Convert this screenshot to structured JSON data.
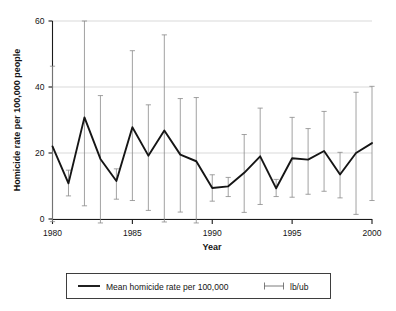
{
  "chart_data": {
    "type": "line",
    "title": "",
    "xlabel": "Year",
    "ylabel": "Homicide rate per 100,000 people",
    "xlim": [
      1980,
      2000
    ],
    "ylim": [
      0,
      60
    ],
    "yticks": [
      0,
      20,
      40,
      60
    ],
    "ytick_labels": [
      "0",
      "20",
      "40",
      "60"
    ],
    "xticks": [
      1980,
      1985,
      1990,
      1995,
      2000
    ],
    "xtick_labels": [
      "1980",
      "1985",
      "1990",
      "1995",
      "2000"
    ],
    "grid": true,
    "legend_position": "below-plot",
    "x": [
      1980,
      1981,
      1982,
      1983,
      1984,
      1985,
      1986,
      1987,
      1988,
      1989,
      1990,
      1991,
      1992,
      1993,
      1994,
      1995,
      1996,
      1997,
      1998,
      1999,
      2000
    ],
    "categories": [
      "1980",
      "1981",
      "1982",
      "1983",
      "1984",
      "1985",
      "1986",
      "1987",
      "1988",
      "1989",
      "1990",
      "1991",
      "1992",
      "1993",
      "1994",
      "1995",
      "1996",
      "1997",
      "1998",
      "1999",
      "2000"
    ],
    "series": [
      {
        "name": "Mean homicide rate per 100,000",
        "values": [
          22.0,
          10.8,
          30.8,
          18.2,
          11.5,
          27.8,
          19.2,
          26.8,
          19.5,
          17.5,
          9.4,
          9.9,
          14.0,
          19.0,
          9.3,
          18.4,
          18.0,
          20.6,
          13.5,
          20.0,
          23.0
        ]
      },
      {
        "name": "lb/ub",
        "lower": [
          -0.8,
          7.0,
          4.0,
          -2.8,
          6.0,
          5.6,
          2.6,
          -0.9,
          2.1,
          -1.5,
          5.4,
          6.8,
          2.0,
          4.4,
          6.8,
          6.6,
          7.5,
          8.4,
          6.4,
          1.4,
          5.6
        ],
        "upper": [
          46.3,
          14.8,
          60.0,
          37.4,
          15.2,
          51.0,
          34.6,
          55.8,
          36.5,
          36.8,
          13.4,
          12.6,
          25.6,
          33.6,
          12.0,
          30.8,
          27.4,
          32.6,
          20.2,
          38.4,
          40.2
        ]
      }
    ],
    "legend": [
      {
        "label": "Mean homicide rate per 100,000",
        "marker": "line",
        "color": "#151515"
      },
      {
        "label": "lb/ub",
        "marker": "errorbar",
        "color": "#6e6e6e"
      }
    ]
  },
  "colors": {
    "series_line": "#151515",
    "error_bar": "#8a8a8a",
    "gridline": "#c8c8c8",
    "axis": "#1a1a1a",
    "background": "#ffffff"
  }
}
